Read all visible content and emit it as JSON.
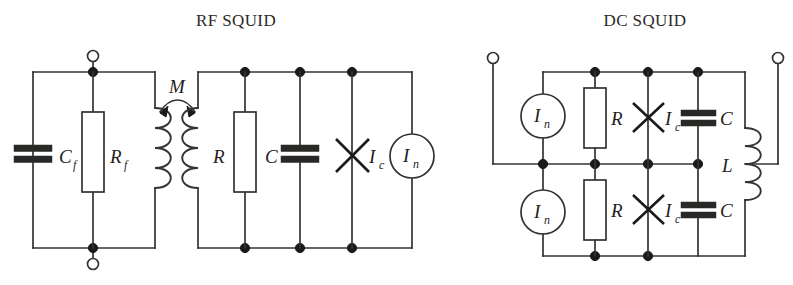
{
  "figure": {
    "background": "#ffffff",
    "ink": "#35332f",
    "panels": [
      {
        "id": "rf",
        "title": "RF SQUID"
      },
      {
        "id": "dc",
        "title": "DC SQUID"
      }
    ]
  },
  "rf_squid": {
    "title": "RF SQUID",
    "feedback_loop": {
      "terminal_top": "open-terminal",
      "terminal_bottom": "open-terminal",
      "capacitor_label": "C",
      "capacitor_sub": "f",
      "resistor_label": "R",
      "resistor_sub": "f",
      "coil_label": "feedback-coil"
    },
    "coupling": {
      "label": "M",
      "symbol": "mutual-inductance-arrow"
    },
    "tank_loop": {
      "coil_label": "squid-coil",
      "resistor_label": "R",
      "capacitor_label": "C",
      "junction_label": "I",
      "junction_sub": "c",
      "source_label": "I",
      "source_sub": "n"
    }
  },
  "dc_squid": {
    "title": "DC SQUID",
    "terminal_left": "open-terminal",
    "terminal_right": "open-terminal",
    "branches": [
      {
        "name": "upper-branch",
        "source_label": "I",
        "source_sub": "n",
        "resistor_label": "R",
        "junction_label": "I",
        "junction_sub": "c",
        "capacitor_label": "C"
      },
      {
        "name": "lower-branch",
        "source_label": "I",
        "source_sub": "n",
        "resistor_label": "R",
        "junction_label": "I",
        "junction_sub": "c",
        "capacitor_label": "C"
      }
    ],
    "inductor_label": "L"
  }
}
